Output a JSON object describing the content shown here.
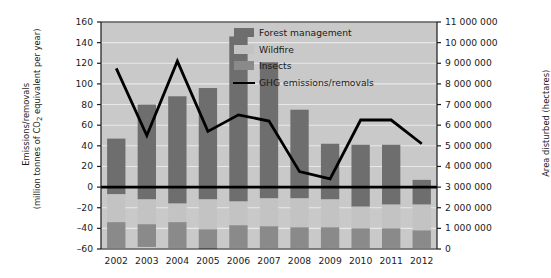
{
  "chart_data": {
    "type": "bar",
    "title": "",
    "xlabel": "",
    "ylabel": "Emissions/removals (million tonnes of CO2 equivalent per year)",
    "ylabel_line1": "Emissions/removals",
    "ylabel_line2_pre": "(million tonnes of CO",
    "ylabel_line2_sub": "2",
    "ylabel_line2_post": " equivalent per year)",
    "ylabel_right": "Area disturbed (hectares)",
    "categories": [
      "2002",
      "2003",
      "2004",
      "2005",
      "2006",
      "2007",
      "2008",
      "2009",
      "2010",
      "2011",
      "2012"
    ],
    "ylim": [
      -60,
      160
    ],
    "yticks": [
      -60,
      -40,
      -20,
      0,
      20,
      40,
      60,
      80,
      100,
      120,
      140,
      160
    ],
    "ytick_labels": [
      "–60",
      "–40",
      "–20",
      "0",
      "20",
      "40",
      "60",
      "80",
      "100",
      "120",
      "140",
      "160"
    ],
    "ylim_right": [
      0,
      11000000
    ],
    "yticks_right": [
      0,
      1000000,
      2000000,
      3000000,
      4000000,
      5000000,
      6000000,
      7000000,
      8000000,
      9000000,
      10000000,
      11000000
    ],
    "ytick_labels_right": [
      "0",
      "1 000 000",
      "2 000 000",
      "3 000 000",
      "4 000 000",
      "5 000 000",
      "6 000 000",
      "7 000 000",
      "8 000 000",
      "9 000 000",
      "10 000 000",
      "11 000 000"
    ],
    "grid": true,
    "legend_position": "upper right",
    "stacked": true,
    "series": [
      {
        "name": "Forest management",
        "color": "#6e6e6e",
        "axis": "right",
        "values_positive_mt": [
          47,
          80,
          88,
          96,
          146,
          121,
          75,
          42,
          41,
          41,
          7
        ],
        "values_negative_mt": [
          -7,
          -12,
          -16,
          -12,
          -14,
          -11,
          -11,
          -12,
          -19,
          -17,
          -17
        ]
      },
      {
        "name": "Wildfire",
        "color": "#c3c3c3",
        "axis": "right",
        "values_negative_mt": [
          -27,
          -24,
          -18,
          -29,
          -23,
          -27,
          -28,
          -27,
          -21,
          -23,
          -25
        ]
      },
      {
        "name": "Insects",
        "color": "#8a8a8a",
        "axis": "right",
        "values_negative_mt": [
          -25,
          -22,
          -25,
          -19,
          -22,
          -21,
          -20,
          -20,
          -19,
          -19,
          -17
        ]
      },
      {
        "name": "GHG emissions/removals",
        "color": "#000000",
        "type": "line",
        "axis": "left",
        "values": [
          115,
          50,
          122,
          54,
          70,
          64,
          15,
          8,
          65,
          65,
          42
        ]
      }
    ]
  },
  "legend": {
    "items": [
      {
        "label": "Forest management",
        "color": "#6e6e6e",
        "kind": "swatch"
      },
      {
        "label": "Wildfire",
        "color": "#c3c3c3",
        "kind": "swatch"
      },
      {
        "label": "Insects",
        "color": "#8a8a8a",
        "kind": "swatch"
      },
      {
        "label": "GHG emissions/removals",
        "color": "#000000",
        "kind": "line"
      }
    ]
  },
  "colors": {
    "plot_background": "#c9c9c9",
    "gridline": "#e8e8e8",
    "axis": "#1a1a1a",
    "zero_line": "#000000"
  }
}
